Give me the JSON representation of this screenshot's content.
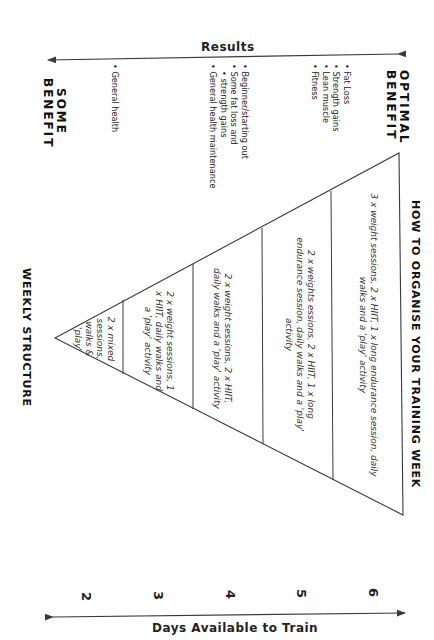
{
  "title": "HOW TO ORGANISE YOUR TRAINING WEEK",
  "results_axis": {
    "label": "Results",
    "high_end_label_line1": "OPTIMAL",
    "high_end_label_line2": "BENEFIT",
    "low_end_label_line1": "SOME",
    "low_end_label_line2": "BENEFIT"
  },
  "benefit_groups": [
    {
      "items": [
        "Fat Loss",
        "Strength gains",
        "Lean muscle",
        "Fitness"
      ]
    },
    {
      "items": [
        "Beginner/starting out",
        "Some fat loss and",
        "strength gains",
        "General health maintenance"
      ]
    },
    {
      "items": [
        "General health"
      ]
    }
  ],
  "days_axis": {
    "label": "Days Available to Train",
    "ticks": [
      "2",
      "3",
      "4",
      "5",
      "6"
    ]
  },
  "pyramid_label": "WEEKLY STRUCTURE",
  "tiers": [
    {
      "days": "6",
      "text": "3 x weight sessions, 2 x HIIT, 1 x long endurance session, daily walks and a 'play' activity"
    },
    {
      "days": "5",
      "text": "2 x weights essions, 2 x HIIT, 1 x long endurance session, daily walks and a 'play' activity"
    },
    {
      "days": "4",
      "text": "2 x weight sessions, 2 x HIIT, daily walks and a 'play' activity"
    },
    {
      "days": "3",
      "text": "2 x weight sessions, 1 x HIIT, daily walks and a 'play' activity"
    },
    {
      "days": "2",
      "text": "2 x mixed sessions, walks & 'play'"
    }
  ],
  "colors": {
    "line": "#3a3a3a",
    "text": "#1a1a1a",
    "background": "#ffffff"
  }
}
